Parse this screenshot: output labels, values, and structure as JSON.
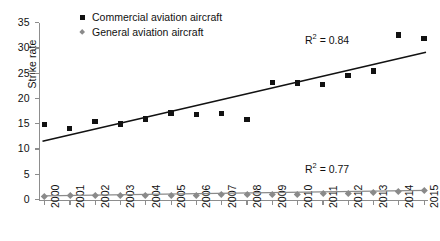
{
  "chart_data": {
    "type": "scatter",
    "title": "",
    "xlabel": "",
    "ylabel": "Strike rate",
    "xlim": [
      2000,
      2015
    ],
    "ylim": [
      0,
      35
    ],
    "yticks": [
      0,
      5,
      10,
      15,
      20,
      25,
      30,
      35
    ],
    "grid": false,
    "legend_position": "top-center",
    "categories": [
      "2000",
      "2001",
      "2002",
      "2003",
      "2004",
      "2005",
      "2006",
      "2007",
      "2008",
      "2009",
      "2010",
      "2011",
      "2012",
      "2013",
      "2014",
      "2015"
    ],
    "series": [
      {
        "name": "Commercial aviation aircraft",
        "marker": "square",
        "color": "#121212",
        "values": [
          14.8,
          14.0,
          15.4,
          14.9,
          15.9,
          17.1,
          16.8,
          17.0,
          15.8,
          23.1,
          23.0,
          22.7,
          24.5,
          25.4,
          32.5,
          31.8
        ],
        "trendline": {
          "start": 11.5,
          "end": 29.1,
          "r_squared": "0.84"
        }
      },
      {
        "name": "General aviation aircraft",
        "marker": "diamond",
        "color": "#8a8a8a",
        "values": [
          0.7,
          0.8,
          0.9,
          0.85,
          0.9,
          0.9,
          0.85,
          0.95,
          0.95,
          1.05,
          1.1,
          1.2,
          1.3,
          1.45,
          1.65,
          1.8
        ],
        "trendline": {
          "start": 0.72,
          "end": 1.8,
          "r_squared": "0.77"
        }
      }
    ],
    "annotations": [
      {
        "text": "R² = 0.84",
        "label": "R",
        "exponent": "2",
        "value": "= 0.84"
      },
      {
        "text": "R² = 0.77",
        "label": "R",
        "exponent": "2",
        "value": "= 0.77"
      }
    ]
  },
  "axis": {
    "ylabel": "Strike rate",
    "ytick_labels": [
      "35",
      "30",
      "25",
      "20",
      "15",
      "10",
      "5",
      "0"
    ],
    "xtick_labels": [
      "2000",
      "2001",
      "2002",
      "2003",
      "2004",
      "2005",
      "2006",
      "2007",
      "2008",
      "2009",
      "2010",
      "2011",
      "2012",
      "2013",
      "2014",
      "2015"
    ]
  },
  "legend": {
    "items": [
      {
        "label": "Commercial aviation aircraft",
        "marker": "square",
        "color": "#121212"
      },
      {
        "label": "General aviation aircraft",
        "marker": "diamond",
        "color": "#8a8a8a"
      }
    ]
  },
  "annotations": {
    "r2_commercial_prefix": "R",
    "r2_commercial_sup": "2",
    "r2_commercial_value": "= 0.84",
    "r2_general_prefix": "R",
    "r2_general_sup": "2",
    "r2_general_value": "= 0.77"
  }
}
